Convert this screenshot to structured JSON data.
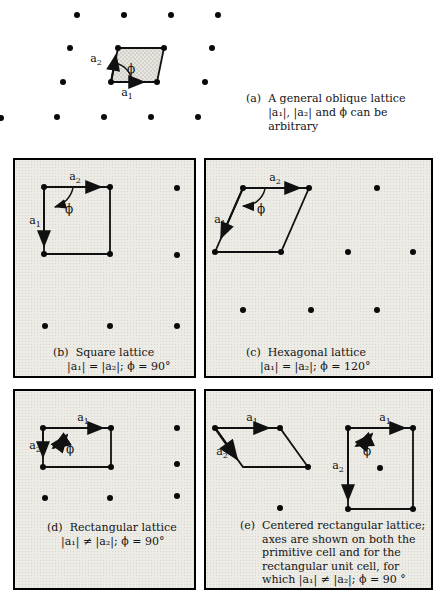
{
  "figure": {
    "description_visible": false
  },
  "sym": {
    "a1": {
      "base": "a",
      "sub": "1"
    },
    "a2": {
      "base": "a",
      "sub": "2"
    },
    "phi": "ϕ"
  },
  "panels": {
    "a": {
      "tag": "(a)",
      "caption": [
        "A general oblique lattice",
        "|a₁|, |a₂| and ϕ can be",
        "arbitrary"
      ]
    },
    "b": {
      "tag": "(b)",
      "title": "Square lattice",
      "formula": "|a₁| = |a₂|; ϕ = 90°"
    },
    "c": {
      "tag": "(c)",
      "title": "Hexagonal lattice",
      "formula": "|a₁| = |a₂|; ϕ = 120°"
    },
    "d": {
      "tag": "(d)",
      "title": "Rectangular lattice",
      "formula": "|a₁| ≠ |a₂|; ϕ = 90°"
    },
    "e": {
      "tag": "(e)",
      "caption": [
        "Centered rectangular lattice;",
        "axes are shown on both the",
        "primitive cell and for the",
        "rectangular unit cell, for",
        "which |a₁| ≠ |a₂|; ϕ = 90 °"
      ]
    }
  },
  "colors": {
    "ink": "#111111",
    "panel_background": "#ecebe6",
    "page_background": "#ffffff"
  }
}
